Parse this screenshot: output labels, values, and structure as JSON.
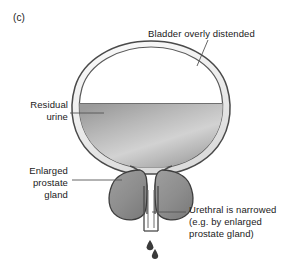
{
  "figure": {
    "panel_label": "(c)",
    "background_color": "#ffffff",
    "text_color": "#1a1a1a"
  },
  "labels": {
    "bladder": "Bladder overly distended",
    "residual_urine": "Residual\nurine",
    "enlarged_prostate": "Enlarged\nprostate\ngland",
    "urethra_narrowed": "Urethral is narrowed\n(e.g. by enlarged\nprostate gland)"
  },
  "anatomy": {
    "bladder_wall_outline_color": "#4a4a4a",
    "bladder_wall_fill_color": "#efefef",
    "bladder_lumen_color": "#ffffff",
    "urine_color_dark": "#8f8f8f",
    "urine_color_light": "#d7d7d7",
    "prostate_fill_color": "#8e8e8e",
    "prostate_outline_color": "#3d3d3d",
    "urethra_outline_color": "#4a4a4a",
    "urethra_fill_color": "#f2f2f2",
    "drip_color": "#3a3a3a",
    "leader_line_color": "#555555"
  }
}
